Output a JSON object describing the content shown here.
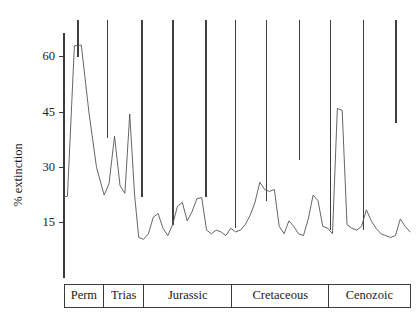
{
  "chart_data": {
    "type": "line",
    "title": "",
    "subtitle": "",
    "xlabel": "",
    "ylabel": "% extinction",
    "ylim": [
      0,
      70
    ],
    "xlim": [
      0,
      100
    ],
    "grid": false,
    "legend": null,
    "y_ticks": [
      15,
      30,
      45,
      60
    ],
    "y_tick_labels": [
      "15",
      "30",
      "45",
      "60"
    ],
    "series": [
      {
        "name": "% extinction",
        "color": "#555555",
        "x": [
          0.0,
          1.0,
          3.0,
          5.0,
          7.2,
          9.4,
          11.6,
          13.0,
          14.6,
          16.2,
          17.6,
          19.0,
          20.4,
          21.6,
          23.0,
          24.4,
          25.8,
          27.2,
          28.6,
          30.0,
          31.4,
          32.8,
          34.2,
          35.6,
          37.0,
          38.4,
          39.8,
          41.2,
          42.6,
          44.0,
          45.4,
          46.8,
          48.2,
          49.6,
          51.0,
          52.4,
          53.8,
          55.2,
          56.6,
          58.0,
          59.4,
          60.8,
          62.2,
          63.6,
          65.0,
          66.4,
          67.8,
          69.2,
          70.6,
          72.0,
          73.4,
          74.8,
          76.2,
          77.6,
          79.0,
          80.4,
          81.8,
          83.2,
          84.6,
          86.0,
          87.4,
          88.8,
          90.2,
          91.6,
          93.0,
          94.4,
          95.8,
          97.2,
          98.6,
          100.0
        ],
        "y": [
          22.0,
          22.2,
          63.0,
          63.2,
          45.0,
          30.0,
          22.5,
          25.5,
          38.5,
          25.0,
          23.0,
          44.5,
          22.5,
          11.0,
          10.5,
          12.0,
          16.5,
          17.5,
          13.5,
          11.5,
          14.5,
          19.5,
          20.5,
          15.5,
          18.0,
          21.5,
          21.8,
          13.0,
          12.0,
          13.0,
          12.5,
          11.5,
          13.5,
          12.5,
          13.0,
          14.5,
          17.0,
          20.5,
          26.0,
          24.0,
          23.5,
          24.0,
          14.0,
          12.0,
          15.5,
          14.0,
          12.0,
          11.5,
          16.0,
          22.5,
          21.0,
          14.0,
          13.5,
          12.0,
          46.0,
          45.5,
          14.5,
          13.5,
          13.0,
          14.0,
          18.5,
          15.5,
          13.5,
          12.0,
          11.5,
          11.0,
          11.5,
          16.0,
          14.0,
          12.5
        ]
      }
    ],
    "stage_markers": {
      "note": "vertical boundary tick lines descending from top of plot",
      "positions_pct": [
        4.0,
        12.5,
        22.5,
        31.5,
        41.0,
        49.5,
        58.5,
        68.0,
        77.0,
        86.5,
        96.0
      ],
      "depths_pct_extinction": [
        60.0,
        38.0,
        22.0,
        14.5,
        22.0,
        13.5,
        21.0,
        32.0,
        13.0,
        13.0,
        42.0
      ]
    },
    "period_axis": {
      "label": "geologic periods",
      "periods": [
        {
          "name": "Perm",
          "start_pct": 0.0,
          "end_pct": 11.5
        },
        {
          "name": "Trias",
          "start_pct": 11.5,
          "end_pct": 23.0
        },
        {
          "name": "Jurassic",
          "start_pct": 23.0,
          "end_pct": 48.5
        },
        {
          "name": "Cretaceous",
          "start_pct": 48.5,
          "end_pct": 76.5
        },
        {
          "name": "Cenozoic",
          "start_pct": 76.5,
          "end_pct": 100.0
        }
      ]
    }
  },
  "colors": {
    "curve": "#555555",
    "axis": "#3a3a3a",
    "marker": "#3f3f3f",
    "background": "#ffffff",
    "text": "#1a1a1a"
  }
}
